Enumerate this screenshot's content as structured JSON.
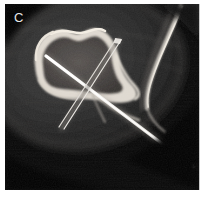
{
  "figure": {
    "panel_label": "C",
    "modality": "ct-axial-cross-section",
    "width": 204,
    "height": 197
  },
  "frame": {
    "background_color": "#050505",
    "margin_color": "#ffffff",
    "inner_left": 5,
    "inner_top": 4,
    "inner_width": 194,
    "inner_height": 186
  },
  "anatomy": {
    "soft_tissue": {
      "name": "soft-tissue-envelope",
      "fill_color": "#2a2a2a",
      "cx": 84,
      "cy": 72,
      "rx": 96,
      "ry": 76,
      "rotation_deg": -18
    },
    "bone_cortex": {
      "name": "tibia-cortex",
      "color": "#d8d4cc",
      "cx": 58,
      "cy": 60,
      "rx": 38,
      "ry": 32
    },
    "medullary_cavity": {
      "name": "medullary-cavity",
      "color": "#4a4744",
      "cx": 56,
      "cy": 60,
      "rx": 30,
      "ry": 24
    },
    "lateral_bone": {
      "name": "fibula-cortex",
      "color": "#cfcac2",
      "description": "curved bright cortical arc at right of field"
    }
  },
  "hardware": {
    "pins": [
      {
        "name": "k-wire-thick-bright",
        "label": "fixation-pin-1",
        "color": "#f4f2ee",
        "x1": 41,
        "y1": 52,
        "x2": 186,
        "y2": 162,
        "width": 3.4,
        "style": "solid"
      },
      {
        "name": "k-wire-thin-double",
        "label": "fixation-pin-2",
        "color": "#ebe8e2",
        "x1": 113,
        "y1": 38,
        "x2": 58,
        "y2": 122,
        "width": 1.5,
        "style": "double-line"
      }
    ],
    "crossing_point": {
      "x": 83,
      "y": 84
    }
  },
  "colors": {
    "air": "#050505",
    "soft_tissue": "#2b2b2b",
    "fat": "#1e1e1e",
    "cortical_bone": "#ded9d1",
    "metal": "#f5f3ef",
    "label_text": "#e8e8e8"
  }
}
